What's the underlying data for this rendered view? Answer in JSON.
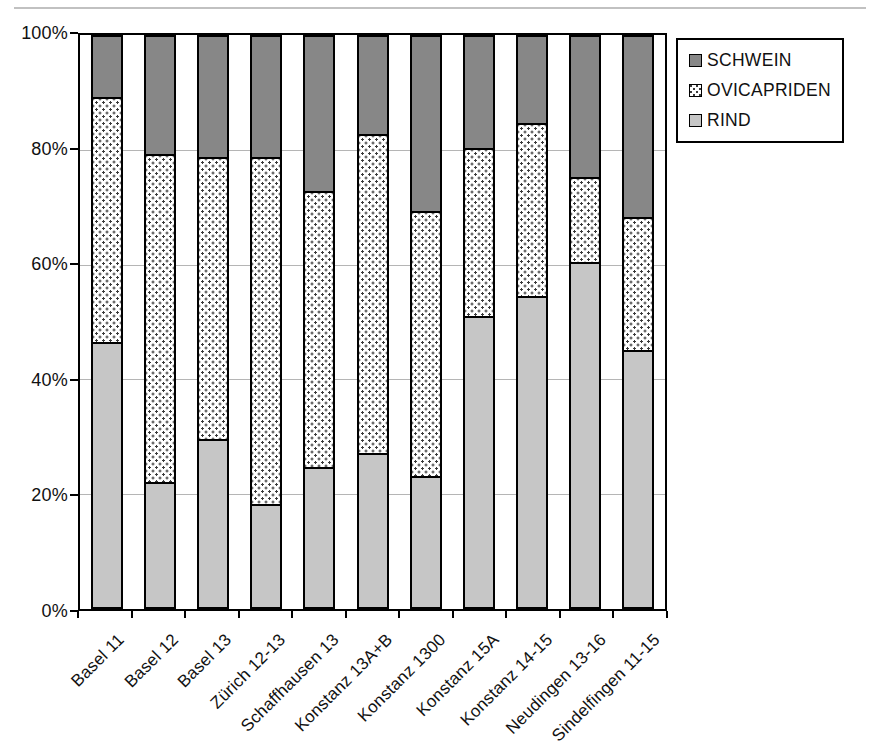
{
  "figure": {
    "background": "#ffffff",
    "palette": {
      "axis": "#000000",
      "grid": "#b5b5b5",
      "schwein_fill": "#878787",
      "rind_fill": "#c6c6c6",
      "ovicapriden_bg": "#ffffff",
      "ovicapriden_dot": "#3a3a3a"
    }
  },
  "legend": {
    "items": [
      {
        "label": "SCHWEIN",
        "swatch": "solid-dark"
      },
      {
        "label": "OVICAPRIDEN",
        "swatch": "dotted"
      },
      {
        "label": "RIND",
        "swatch": "solid-light"
      }
    ]
  },
  "chart_data": {
    "type": "bar",
    "stacked": true,
    "percent_stacked": true,
    "title": "",
    "xlabel": "",
    "ylabel": "",
    "ylim": [
      0,
      100
    ],
    "grid": "horizontal-20pct",
    "legend_position": "top-right",
    "y_ticks": [
      "0%",
      "20%",
      "40%",
      "60%",
      "80%",
      "100%"
    ],
    "categories": [
      "Basel 11",
      "Basel 12",
      "Basel 13",
      "Zürich 12-13",
      "Schaffhausen 13",
      "Konstanz 13A+B",
      "Konstanz 1300",
      "Konstanz 15A",
      "Konstanz 14-15",
      "Neudingen 13-16",
      "Sindelfingen 11-15"
    ],
    "series": [
      {
        "name": "RIND",
        "style": "solid-light",
        "color": "#c6c6c6",
        "values": [
          46.5,
          22,
          29.5,
          18,
          24.5,
          27,
          23,
          51,
          54.5,
          60.5,
          45
        ]
      },
      {
        "name": "OVICAPRIDEN",
        "style": "dotted",
        "color": "#ffffff",
        "dot_color": "#3a3a3a",
        "values": [
          43,
          57.5,
          49.5,
          61,
          48.5,
          56,
          46.5,
          29.5,
          30.5,
          15,
          23.5
        ]
      },
      {
        "name": "SCHWEIN",
        "style": "solid-dark",
        "color": "#878787",
        "values": [
          10.5,
          20.5,
          21,
          21,
          27,
          17,
          30.5,
          19.5,
          15,
          24.5,
          31.5
        ]
      }
    ]
  }
}
